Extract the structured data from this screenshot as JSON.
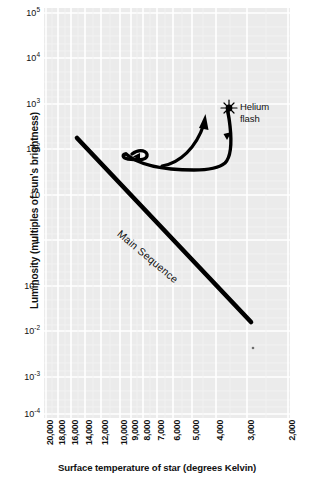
{
  "chart_data": {
    "type": "line",
    "title": "",
    "subtitle": "",
    "xlabel": "Surface temperature of star (degrees Kelvin)",
    "ylabel": "Luminosity (multiples of sun's brightness)",
    "x_axis": {
      "scale": "log-reversed",
      "direction": "decreasing",
      "min": 2000,
      "max": 20000,
      "tick_values": [
        20000,
        18000,
        16000,
        14000,
        12000,
        10000,
        9000,
        8000,
        7000,
        6000,
        5000,
        4000,
        3000,
        2000
      ],
      "tick_labels": [
        "20,000",
        "18,000",
        "16,000",
        "14,000",
        "12,000",
        "10,000",
        "9,000",
        "8,000",
        "7,000",
        "6,000",
        "5,000",
        "4,000",
        "3,000",
        "2,000"
      ]
    },
    "y_axis": {
      "scale": "log",
      "min": 0.0001,
      "max": 100000,
      "tick_values": [
        100000,
        10000,
        1000,
        100,
        10,
        1,
        0.1,
        0.01,
        0.001,
        0.0001
      ],
      "tick_labels": [
        "10⁵",
        "10⁴",
        "10³",
        "10²",
        "10",
        "1",
        "10⁻¹",
        "10⁻²",
        "10⁻³",
        "10⁻⁴"
      ],
      "tick_mantissa": [
        "10",
        "10",
        "10",
        "10",
        "10",
        "1",
        "10",
        "10",
        "10",
        "10"
      ],
      "tick_exponent": [
        "5",
        "4",
        "3",
        "2",
        "",
        "",
        "-1",
        "-2",
        "-3",
        "-4"
      ]
    },
    "grid": true,
    "legend_position": "none",
    "series": [
      {
        "name": "Main Sequence",
        "type": "line",
        "style": "thick-solid",
        "color": "#000000",
        "points": [
          {
            "temperature": 14000,
            "luminosity": 200
          },
          {
            "temperature": 3200,
            "luminosity": 0.015
          }
        ],
        "label": "Main Sequence",
        "label_rotation_deg": 40
      },
      {
        "name": "Post-main-sequence evolutionary track",
        "type": "curve",
        "style": "thick-solid-with-arrows",
        "color": "#000000",
        "description": "Track leaves main sequence near 9,000 K, loops left, runs right along luminosity ~45, then climbs steeply to the helium flash near 3,500 K at luminosity ~800.",
        "points": [
          {
            "temperature": 9200,
            "luminosity": 55
          },
          {
            "temperature": 9500,
            "luminosity": 48
          },
          {
            "temperature": 9100,
            "luminosity": 42
          },
          {
            "temperature": 7600,
            "luminosity": 42
          },
          {
            "temperature": 5400,
            "luminosity": 39
          },
          {
            "temperature": 4400,
            "luminosity": 38
          },
          {
            "temperature": 4000,
            "luminosity": 55
          },
          {
            "temperature": 3800,
            "luminosity": 140
          },
          {
            "temperature": 3600,
            "luminosity": 420
          },
          {
            "temperature": 3500,
            "luminosity": 800
          }
        ],
        "arrow_markers": 3
      },
      {
        "name": "Ascending branch arrow",
        "type": "arrow",
        "color": "#000000",
        "description": "Short upward-curving arrow rising from the horizontal segment toward higher luminosity",
        "points": [
          {
            "temperature": 5800,
            "luminosity": 40
          },
          {
            "temperature": 4600,
            "luminosity": 300
          }
        ]
      }
    ],
    "markers": [
      {
        "name": "helium-flash",
        "symbol": "starburst",
        "temperature": 3500,
        "luminosity": 800,
        "label": "Helium\nflash",
        "label_lines": [
          "Helium",
          "flash"
        ]
      },
      {
        "name": "white-dwarf-dot",
        "symbol": "small-dot",
        "temperature": 3200,
        "luminosity": 0.003,
        "label": ""
      }
    ],
    "annotations": [
      {
        "name": "main-sequence-text",
        "text": "Main Sequence",
        "rotation_deg": 40
      },
      {
        "name": "helium-flash-text",
        "text": "Helium flash"
      }
    ],
    "colors": {
      "plot_background": "#ebebeb",
      "gridline": "#ffffff",
      "curve": "#000000",
      "text": "#111111",
      "page_background": "#ffffff"
    }
  },
  "axes": {
    "y_title": "Luminosity (multiples of sun's brightness)",
    "x_title": "Surface temperature of star (degrees Kelvin)"
  },
  "labels": {
    "helium_flash_line1": "Helium",
    "helium_flash_line2": "flash",
    "main_sequence": "Main Sequence"
  }
}
